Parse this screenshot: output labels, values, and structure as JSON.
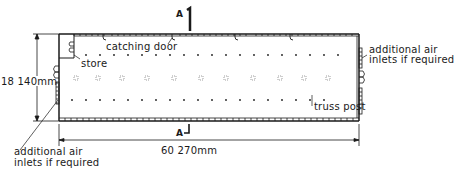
{
  "drawing": {
    "type": "floor-plan",
    "labels": {
      "catching_door": "catching door",
      "store": "store",
      "air_inlets_right_line1": "additional air",
      "air_inlets_right_line2": "inlets if required",
      "air_inlets_left_line1": "additional air",
      "air_inlets_left_line2": "inlets if required",
      "truss_post": "truss post"
    },
    "dimensions": {
      "width": "18 140mm",
      "length": "60 270mm"
    },
    "section_marks": {
      "top": "A",
      "bottom": "A"
    },
    "colors": {
      "ink": "#1a1a1a",
      "background": "#ffffff"
    }
  }
}
